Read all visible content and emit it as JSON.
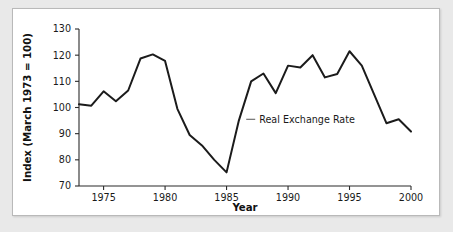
{
  "chart_data": {
    "type": "line",
    "title": "",
    "xlabel": "Year",
    "ylabel": "Index (March 1973 = 100)",
    "xlim": [
      1973,
      2000
    ],
    "ylim": [
      70,
      130
    ],
    "xticks": [
      1975,
      1980,
      1985,
      1990,
      1995,
      2000
    ],
    "yticks": [
      70,
      80,
      90,
      100,
      110,
      120,
      130
    ],
    "grid": false,
    "legend_position": "inline-annotation",
    "annotations": [
      {
        "text": "Real Exchange Rate",
        "x": 1986.6,
        "y": 95.5
      }
    ],
    "series": [
      {
        "name": "Real Exchange Rate",
        "color": "#1b1b1b",
        "x": [
          1973,
          1974,
          1975,
          1976,
          1977,
          1978,
          1979,
          1980,
          1981,
          1982,
          1983,
          1984,
          1985,
          1986,
          1987,
          1988,
          1989,
          1990,
          1991,
          1992,
          1993,
          1994,
          1995,
          1996,
          1997,
          1998,
          1999,
          2000
        ],
        "values": [
          101.2,
          100.7,
          106.2,
          102.4,
          106.5,
          118.7,
          120.3,
          117.8,
          99.5,
          89.5,
          85.5,
          80.0,
          75.2,
          95.0,
          110.0,
          113.0,
          105.5,
          116.0,
          115.3,
          120.0,
          111.5,
          112.8,
          121.5,
          116.0,
          105.0,
          94.0,
          95.5,
          90.8
        ]
      }
    ]
  },
  "axes": {
    "x_title": "Year",
    "y_title": "Index (March 1973 = 100)"
  }
}
